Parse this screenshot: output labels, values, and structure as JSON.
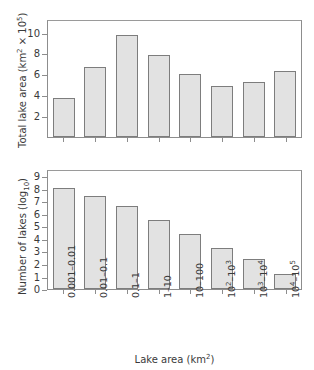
{
  "chart_data": [
    {
      "type": "bar",
      "panel": "top",
      "title": "",
      "xlabel": "",
      "ylabel": "Total lake area (km² × 10⁵)",
      "ylabel_parts": {
        "main": "Total lake area (km",
        "sup1": "2",
        "mid": " × 10",
        "sup2": "5",
        "tail": ")"
      },
      "categories": [
        "0.001–0.01",
        "0.01–0.1",
        "0.1–1",
        "1–10",
        "10–100",
        "10²–10³",
        "10³–10⁴",
        "10⁴–10⁵"
      ],
      "values": [
        3.75,
        6.7,
        9.75,
        7.9,
        6.0,
        4.9,
        5.25,
        6.35
      ],
      "ylim": [
        0,
        11.3
      ],
      "yticks": [
        2,
        4,
        6,
        8,
        10
      ],
      "ytick_labels": [
        "2",
        "4",
        "6",
        "8",
        "10"
      ],
      "grid": false,
      "legend": "none"
    },
    {
      "type": "bar",
      "panel": "bottom",
      "title": "",
      "xlabel": "Lake area (km²)",
      "xlabel_parts": {
        "main": "Lake area (km",
        "sup": "2",
        "tail": ")"
      },
      "ylabel": "Number of lakes (log₁₀)",
      "ylabel_parts": {
        "main": "Number of lakes (log",
        "sub": "10",
        "tail": ")"
      },
      "categories": [
        "0.001–0.01",
        "0.01–0.1",
        "0.1–1",
        "1–10",
        "10–100",
        "10²–10³",
        "10³–10⁴",
        "10⁴–10⁵"
      ],
      "category_parts": [
        {
          "main": "0.001–0.01"
        },
        {
          "main": "0.01–0.1"
        },
        {
          "main": "0.1–1"
        },
        {
          "main": "1–10"
        },
        {
          "main": "10–100"
        },
        {
          "main": "10",
          "sup1": "2",
          "mid": "–10",
          "sup2": "3"
        },
        {
          "main": "10",
          "sup1": "3",
          "mid": "–10",
          "sup2": "4"
        },
        {
          "main": "10",
          "sup1": "4",
          "mid": "–10",
          "sup2": "5"
        }
      ],
      "values": [
        8.05,
        7.4,
        6.6,
        5.5,
        4.35,
        3.25,
        2.35,
        1.2
      ],
      "ylim": [
        0,
        9.55
      ],
      "yticks": [
        0,
        1,
        2,
        3,
        4,
        5,
        6,
        7,
        8,
        9
      ],
      "ytick_labels": [
        "0",
        "1",
        "2",
        "3",
        "4",
        "5",
        "6",
        "7",
        "8",
        "9"
      ],
      "grid": false,
      "legend": "none"
    }
  ],
  "style": {
    "bar_fill": "#e2e2e2",
    "bar_stroke": "#7d7d7d",
    "axis_color": "#8d8d8d",
    "text_color": "#3a3a3a",
    "background": "#ffffff"
  }
}
